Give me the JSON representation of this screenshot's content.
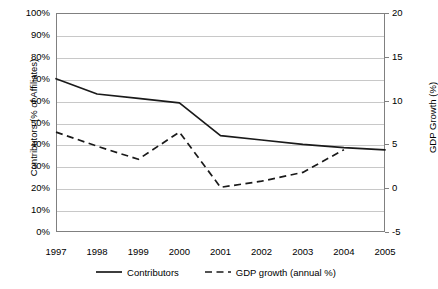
{
  "chart_data": {
    "type": "line",
    "title": "",
    "xlabel": "",
    "ylabel": "Contributors (% of Affiliates)",
    "ylabel_secondary": "GDP Growth (%)",
    "categories": [
      "1997",
      "1998",
      "1999",
      "2000",
      "2001",
      "2002",
      "2003",
      "2004",
      "2005"
    ],
    "ylim": [
      0,
      100
    ],
    "ylim_secondary": [
      -5,
      20
    ],
    "yticks": [
      "0%",
      "10%",
      "20%",
      "30%",
      "40%",
      "50%",
      "60%",
      "70%",
      "80%",
      "90%",
      "100%"
    ],
    "yticks_secondary": [
      "-5",
      "0",
      "5",
      "10",
      "15",
      "20"
    ],
    "grid": true,
    "legend_position": "bottom",
    "series": [
      {
        "name": "Contributors",
        "axis": "left",
        "style": "solid",
        "color": "#1a1a1a",
        "values": [
          70,
          63,
          61,
          59,
          44,
          42,
          40,
          38.5,
          37.5
        ]
      },
      {
        "name": "GDP growth (annual %)",
        "axis": "right",
        "style": "dashed",
        "color": "#1a1a1a",
        "values": [
          6.4,
          4.8,
          3.3,
          6.4,
          0.1,
          0.8,
          1.8,
          4.4,
          null
        ]
      }
    ]
  },
  "legend": {
    "items": [
      {
        "label": "Contributors",
        "style": "solid"
      },
      {
        "label": "GDP growth (annual %)",
        "style": "dashed"
      }
    ]
  },
  "footer": {
    "cutoff_text": ""
  }
}
